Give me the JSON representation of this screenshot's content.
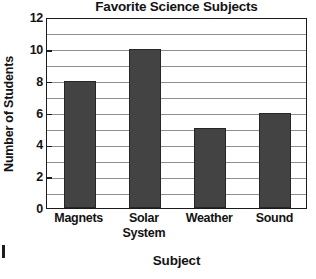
{
  "chart_data": {
    "type": "bar",
    "title": "Favorite Science Subjects",
    "xlabel": "Subject",
    "ylabel": "Number of Students",
    "categories": [
      "Magnets",
      "Solar System",
      "Weather",
      "Sound"
    ],
    "category_lines": [
      [
        "Magnets"
      ],
      [
        "Solar",
        "System"
      ],
      [
        "Weather"
      ],
      [
        "Sound"
      ]
    ],
    "values": [
      8,
      10,
      5,
      6
    ],
    "ylim": [
      0,
      12
    ],
    "ytick_labels": [
      "12",
      "10",
      "8",
      "6",
      "4",
      "2",
      "0"
    ],
    "ytick_values": [
      12,
      10,
      8,
      6,
      4,
      2,
      0
    ],
    "ytick_interval": 2,
    "gridline_interval": 1,
    "grid": true,
    "grid_orientation": "horizontal",
    "legend": null,
    "bar_color": "#434343",
    "bar_edge_color": "#262626",
    "grid_color": "#8f8f8f",
    "axis_color": "#1b1b1b",
    "background_color": "#ffffff"
  },
  "artifacts": {
    "edge_mark": ""
  }
}
